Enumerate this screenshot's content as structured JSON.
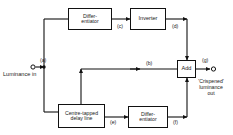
{
  "diagram": {
    "line_color": "#111111",
    "text_color": "#1a1a1a",
    "background": "#ffffff",
    "blocks": [
      {
        "id": "differentiator-top",
        "line1": "Differ-",
        "line2": "entiator"
      },
      {
        "id": "inverter",
        "line1": "Inverter",
        "line2": ""
      },
      {
        "id": "adder",
        "line1": "Add",
        "line2": ""
      },
      {
        "id": "delay-line",
        "line1": "Centre-tapped",
        "line2": "delay line"
      },
      {
        "id": "differentiator-bottom",
        "line1": "Differ-",
        "line2": "entiator"
      }
    ],
    "node_labels": [
      {
        "id": "a",
        "text": "(a)"
      },
      {
        "id": "b",
        "text": "(b)"
      },
      {
        "id": "c",
        "text": "(c)"
      },
      {
        "id": "d",
        "text": "(d)"
      },
      {
        "id": "e",
        "text": "(e)"
      },
      {
        "id": "f",
        "text": "(f)"
      },
      {
        "id": "g",
        "text": "(g)"
      }
    ],
    "terminals": {
      "input_label": "Luminance in",
      "output_label_line1": "'Crispened'",
      "output_label_line2": "luminance",
      "output_label_line3": "out"
    }
  }
}
